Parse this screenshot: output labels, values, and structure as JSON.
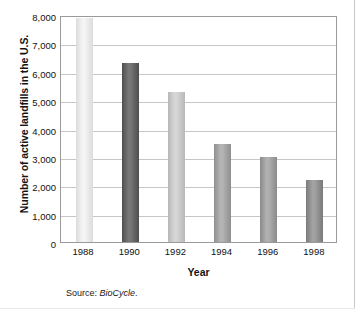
{
  "chart_data": {
    "type": "bar",
    "title": "",
    "subtitle": "",
    "xlabel": "Year",
    "ylabel": "Number of active landfills in the U.S.",
    "categories": [
      "1988",
      "1990",
      "1992",
      "1994",
      "1996",
      "1998"
    ],
    "values": [
      7900,
      6300,
      5300,
      3450,
      3000,
      2200
    ],
    "series": [
      {
        "name": "Active landfills",
        "values": [
          7900,
          6300,
          5300,
          3450,
          3000,
          2200
        ]
      }
    ],
    "ylim": [
      0,
      8000
    ],
    "ytick_values": [
      0,
      1000,
      2000,
      3000,
      4000,
      5000,
      6000,
      7000,
      8000
    ],
    "ytick_labels": [
      "0",
      "1,000",
      "2,000",
      "3,000",
      "4,000",
      "5,000",
      "6,000",
      "7,000",
      "8,000"
    ],
    "grid": "horizontal",
    "legend": "none",
    "bar_colors": [
      "#dcdcdc",
      "#4e4e4e",
      "#b8b8b8",
      "#8f8f8f",
      "#8a8a8a",
      "#7a7a7a"
    ],
    "bar_highlight_colors": [
      "#f4f4f4",
      "#777777",
      "#d6d6d6",
      "#b4b4b4",
      "#b0b0b0",
      "#a2a2a2"
    ],
    "annotations": []
  },
  "source": {
    "prefix": "Source:",
    "name": "BioCycle",
    "suffix": "."
  }
}
